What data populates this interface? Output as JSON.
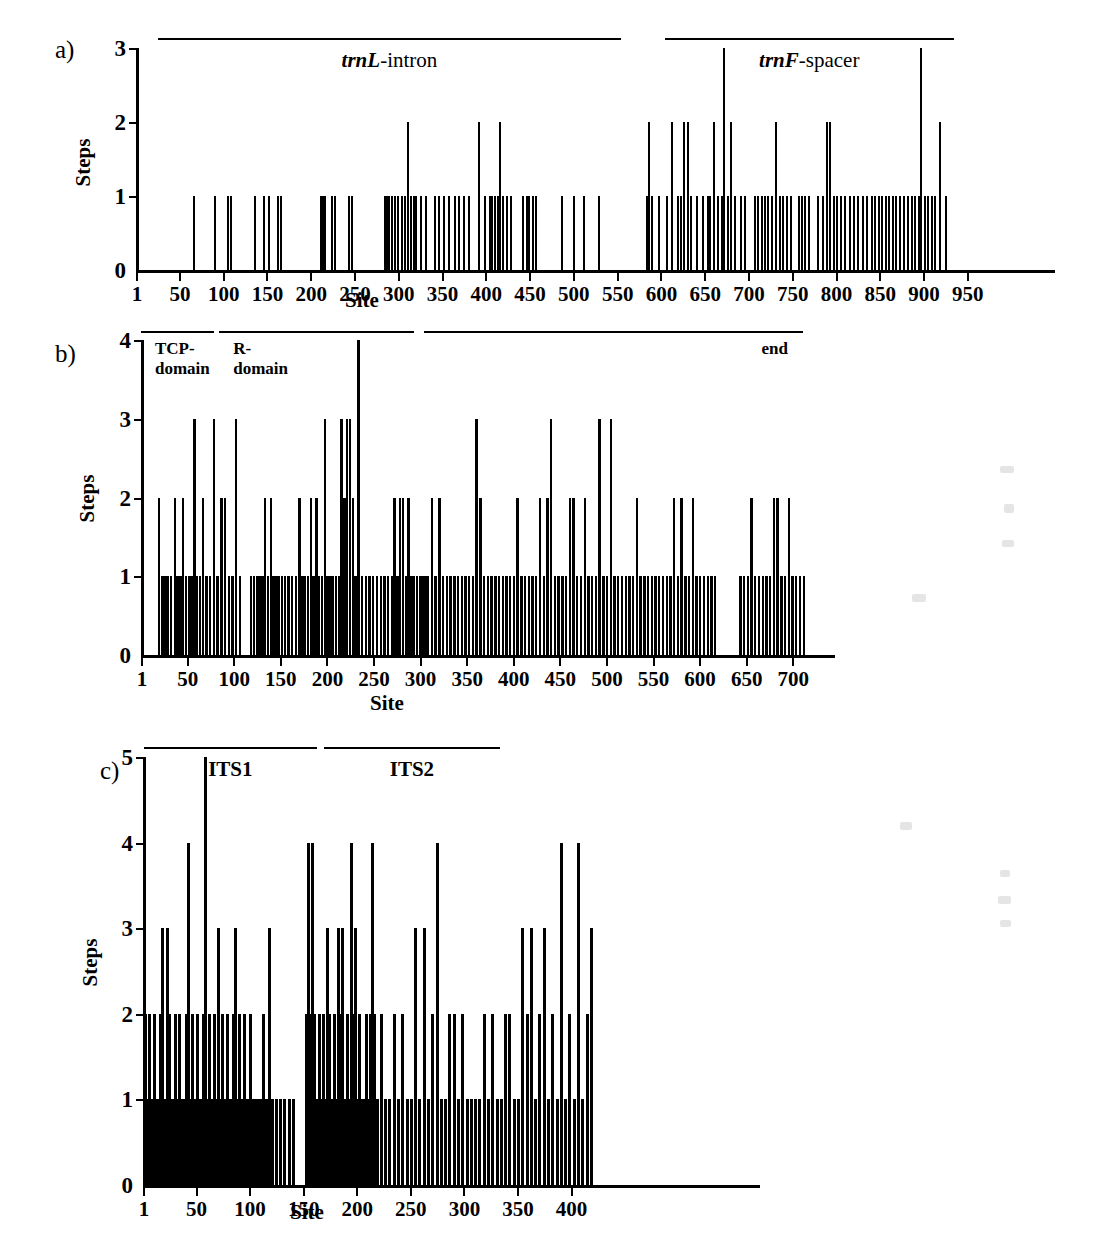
{
  "figure": {
    "panels": [
      {
        "letter": "a)",
        "ylabel": "Steps",
        "xlabel": "Site",
        "yticks": [
          "0",
          "1",
          "2",
          "3"
        ],
        "xticks": [
          "1",
          "50",
          "100",
          "150",
          "200",
          "250",
          "300",
          "350",
          "400",
          "450",
          "500",
          "550",
          "600",
          "650",
          "700",
          "750",
          "800",
          "850",
          "900",
          "950"
        ],
        "regions": [
          {
            "label_html": "<i>trnL</i>-intron",
            "start": 26,
            "end": 555
          },
          {
            "label_html": "<i>trnF</i>-spacer",
            "start": 605,
            "end": 935
          }
        ]
      },
      {
        "letter": "b)",
        "ylabel": "Steps",
        "xlabel": "Site",
        "yticks": [
          "0",
          "1",
          "2",
          "3",
          "4"
        ],
        "xticks": [
          "1",
          "50",
          "100",
          "150",
          "200",
          "250",
          "300",
          "350",
          "400",
          "450",
          "500",
          "550",
          "600",
          "650",
          "700"
        ],
        "regions": [
          {
            "label_html": "TCP-<br>domain",
            "start": 1,
            "end": 79
          },
          {
            "label_html": "R-<br>domain",
            "start": 85,
            "end": 294
          },
          {
            "label_html": "end",
            "start": 305,
            "end": 712
          }
        ]
      },
      {
        "letter": "c)",
        "ylabel": "Steps",
        "xlabel": "Site",
        "yticks": [
          "0",
          "1",
          "2",
          "3",
          "4",
          "5"
        ],
        "xticks": [
          "1",
          "50",
          "100",
          "150",
          "200",
          "250",
          "300",
          "350",
          "400"
        ],
        "regions": [
          {
            "label_html": "ITS1",
            "start": 2,
            "end": 163
          },
          {
            "label_html": "ITS2",
            "start": 170,
            "end": 334
          }
        ]
      }
    ]
  },
  "chart_data": [
    {
      "type": "bar",
      "panel": "a",
      "title": "trnL-trnF region step distribution",
      "xlabel": "Site",
      "ylabel": "Steps",
      "xlim": [
        1,
        960
      ],
      "ylim": [
        0,
        3
      ],
      "xticks": [
        1,
        50,
        100,
        150,
        200,
        250,
        300,
        350,
        400,
        450,
        500,
        550,
        600,
        650,
        700,
        750,
        800,
        850,
        900,
        950
      ],
      "yticks": [
        0,
        1,
        2,
        3
      ],
      "grid": false,
      "legend": null,
      "annotations": [
        {
          "text": "trnL-intron",
          "span": [
            26,
            555
          ]
        },
        {
          "text": "trnF-spacer",
          "span": [
            605,
            935
          ]
        }
      ],
      "x": [
        66,
        90,
        105,
        108,
        136,
        146,
        152,
        162,
        166,
        211,
        213,
        216,
        224,
        227,
        243,
        247,
        284,
        286,
        289,
        292,
        296,
        299,
        304,
        307,
        311,
        314,
        317,
        320,
        325,
        331,
        341,
        346,
        352,
        357,
        364,
        369,
        375,
        380,
        392,
        398,
        404,
        407,
        410,
        413,
        416,
        419,
        424,
        428,
        442,
        446,
        449,
        453,
        457,
        487,
        500,
        512,
        529,
        583,
        586,
        589,
        597,
        606,
        612,
        619,
        622,
        626,
        630,
        634,
        641,
        648,
        653,
        656,
        660,
        665,
        669,
        672,
        676,
        680,
        684,
        691,
        696,
        707,
        710,
        715,
        718,
        722,
        726,
        731,
        735,
        739,
        744,
        748,
        757,
        760,
        764,
        768,
        779,
        784,
        789,
        793,
        797,
        800,
        805,
        810,
        815,
        820,
        825,
        830,
        835,
        840,
        844,
        848,
        852,
        856,
        860,
        864,
        868,
        873,
        877,
        882,
        886,
        890,
        894,
        897,
        901,
        905,
        909,
        913,
        918,
        925
      ],
      "values": [
        1,
        1,
        1,
        1,
        1,
        1,
        1,
        1,
        1,
        1,
        1,
        1,
        1,
        1,
        1,
        1,
        1,
        1,
        1,
        1,
        1,
        1,
        1,
        1,
        2,
        1,
        1,
        1,
        1,
        1,
        1,
        1,
        1,
        1,
        1,
        1,
        1,
        1,
        2,
        1,
        1,
        1,
        1,
        1,
        2,
        1,
        1,
        1,
        1,
        1,
        1,
        1,
        1,
        1,
        1,
        1,
        1,
        1,
        2,
        1,
        1,
        1,
        2,
        1,
        1,
        2,
        2,
        1,
        1,
        1,
        1,
        1,
        2,
        1,
        1,
        3,
        1,
        2,
        1,
        1,
        1,
        1,
        1,
        1,
        1,
        1,
        1,
        2,
        1,
        1,
        1,
        1,
        1,
        1,
        1,
        1,
        1,
        1,
        2,
        2,
        1,
        1,
        1,
        1,
        1,
        1,
        1,
        1,
        1,
        1,
        1,
        1,
        1,
        1,
        1,
        1,
        1,
        1,
        1,
        1,
        1,
        1,
        1,
        3,
        1,
        1,
        1,
        1,
        2,
        1
      ]
    },
    {
      "type": "bar",
      "panel": "b",
      "title": "TCP gene region step distribution",
      "xlabel": "Site",
      "ylabel": "Steps",
      "xlim": [
        1,
        740
      ],
      "ylim": [
        0,
        4
      ],
      "xticks": [
        1,
        50,
        100,
        150,
        200,
        250,
        300,
        350,
        400,
        450,
        500,
        550,
        600,
        650,
        700
      ],
      "yticks": [
        0,
        1,
        2,
        3,
        4
      ],
      "grid": false,
      "legend": null,
      "annotations": [
        {
          "text": "TCP-domain",
          "span": [
            1,
            79
          ]
        },
        {
          "text": "R-domain",
          "span": [
            85,
            294
          ]
        },
        {
          "text": "end",
          "span": [
            305,
            712
          ]
        }
      ],
      "x": [
        19,
        23,
        26,
        29,
        32,
        36,
        39,
        42,
        45,
        48,
        51,
        54,
        57,
        60,
        63,
        66,
        70,
        74,
        78,
        82,
        86,
        90,
        94,
        98,
        102,
        106,
        118,
        121,
        124,
        127,
        130,
        133,
        136,
        139,
        142,
        145,
        148,
        151,
        154,
        158,
        162,
        166,
        170,
        173,
        176,
        179,
        182,
        185,
        188,
        191,
        194,
        197,
        200,
        203,
        206,
        209,
        212,
        215,
        218,
        221,
        224,
        227,
        230,
        233,
        237,
        241,
        245,
        249,
        253,
        257,
        261,
        265,
        269,
        272,
        275,
        278,
        281,
        284,
        287,
        290,
        293,
        296,
        299,
        302,
        305,
        308,
        312,
        316,
        320,
        324,
        328,
        332,
        336,
        340,
        344,
        348,
        352,
        356,
        360,
        364,
        368,
        372,
        376,
        380,
        384,
        388,
        392,
        396,
        400,
        404,
        408,
        412,
        416,
        420,
        424,
        428,
        432,
        436,
        440,
        444,
        448,
        452,
        456,
        460,
        464,
        468,
        472,
        476,
        480,
        484,
        488,
        492,
        496,
        500,
        504,
        508,
        512,
        516,
        520,
        524,
        528,
        532,
        536,
        540,
        544,
        548,
        552,
        556,
        560,
        564,
        568,
        572,
        576,
        580,
        584,
        588,
        592,
        596,
        600,
        604,
        608,
        612,
        616,
        643,
        647,
        651,
        655,
        659,
        663,
        667,
        671,
        675,
        679,
        683,
        687,
        691,
        695,
        699,
        703,
        707,
        711,
        730
      ],
      "values": [
        2,
        1,
        1,
        1,
        1,
        2,
        1,
        1,
        2,
        1,
        1,
        1,
        3,
        1,
        1,
        2,
        1,
        1,
        3,
        1,
        2,
        2,
        1,
        1,
        3,
        1,
        1,
        1,
        1,
        1,
        1,
        2,
        1,
        2,
        1,
        1,
        1,
        1,
        1,
        1,
        1,
        1,
        2,
        1,
        1,
        1,
        2,
        1,
        2,
        1,
        1,
        3,
        1,
        1,
        1,
        1,
        1,
        3,
        2,
        3,
        3,
        2,
        1,
        4,
        1,
        1,
        1,
        1,
        1,
        1,
        1,
        1,
        1,
        2,
        1,
        2,
        2,
        1,
        2,
        1,
        1,
        1,
        1,
        1,
        1,
        1,
        2,
        1,
        2,
        1,
        1,
        1,
        1,
        1,
        1,
        1,
        1,
        1,
        3,
        2,
        1,
        1,
        1,
        1,
        1,
        1,
        1,
        1,
        1,
        2,
        1,
        1,
        1,
        1,
        1,
        2,
        1,
        2,
        3,
        1,
        1,
        1,
        1,
        2,
        2,
        1,
        1,
        2,
        1,
        1,
        1,
        3,
        1,
        1,
        3,
        1,
        1,
        1,
        1,
        1,
        1,
        2,
        1,
        1,
        1,
        1,
        1,
        1,
        1,
        1,
        1,
        2,
        1,
        2,
        1,
        1,
        2,
        1,
        1,
        1,
        1,
        1,
        1,
        1,
        1,
        1,
        2,
        1,
        1,
        1,
        1,
        1,
        2,
        2,
        1,
        1,
        2,
        1,
        1,
        1,
        1
      ],
      "max_site": 730
    },
    {
      "type": "bar",
      "panel": "c",
      "title": "ITS region step distribution",
      "xlabel": "Site",
      "ylabel": "Steps",
      "xlim": [
        1,
        425
      ],
      "ylim": [
        0,
        5
      ],
      "xticks": [
        1,
        50,
        100,
        150,
        200,
        250,
        300,
        350,
        400
      ],
      "yticks": [
        0,
        1,
        2,
        3,
        4,
        5
      ],
      "grid": false,
      "legend": null,
      "annotations": [
        {
          "text": "ITS1",
          "span": [
            2,
            163
          ]
        },
        {
          "text": "ITS2",
          "span": [
            170,
            334
          ]
        }
      ],
      "x": [
        2,
        4,
        6,
        8,
        10,
        12,
        14,
        16,
        18,
        20,
        22,
        24,
        26,
        28,
        30,
        32,
        34,
        36,
        38,
        40,
        42,
        44,
        46,
        48,
        50,
        52,
        54,
        56,
        58,
        60,
        62,
        64,
        66,
        68,
        70,
        72,
        74,
        76,
        78,
        80,
        82,
        84,
        86,
        88,
        90,
        92,
        94,
        96,
        98,
        100,
        102,
        104,
        106,
        108,
        110,
        112,
        114,
        116,
        118,
        120,
        124,
        128,
        132,
        136,
        140,
        152,
        154,
        156,
        158,
        160,
        162,
        164,
        166,
        168,
        170,
        172,
        174,
        176,
        178,
        180,
        182,
        184,
        186,
        188,
        190,
        192,
        194,
        196,
        198,
        200,
        202,
        204,
        206,
        208,
        210,
        212,
        214,
        216,
        218,
        222,
        226,
        230,
        234,
        238,
        242,
        246,
        250,
        254,
        258,
        262,
        266,
        270,
        274,
        278,
        282,
        286,
        290,
        294,
        298,
        302,
        306,
        310,
        314,
        318,
        322,
        326,
        330,
        334,
        338,
        342,
        346,
        350,
        354,
        358,
        362,
        366,
        370,
        374,
        378,
        382,
        386,
        390,
        394,
        398,
        402,
        406,
        410,
        414,
        418
      ],
      "values": [
        2,
        1,
        2,
        1,
        2,
        1,
        1,
        2,
        3,
        1,
        3,
        2,
        1,
        1,
        2,
        1,
        2,
        1,
        1,
        2,
        4,
        1,
        2,
        1,
        2,
        1,
        1,
        2,
        5,
        1,
        2,
        1,
        2,
        1,
        3,
        1,
        2,
        1,
        2,
        1,
        1,
        2,
        3,
        1,
        2,
        1,
        2,
        1,
        1,
        2,
        1,
        1,
        1,
        1,
        1,
        2,
        1,
        1,
        3,
        1,
        1,
        1,
        1,
        1,
        1,
        2,
        4,
        2,
        4,
        2,
        1,
        2,
        1,
        2,
        1,
        3,
        2,
        1,
        2,
        1,
        3,
        2,
        3,
        1,
        2,
        1,
        4,
        2,
        3,
        1,
        2,
        1,
        1,
        2,
        1,
        2,
        4,
        2,
        1,
        2,
        1,
        1,
        2,
        1,
        2,
        1,
        1,
        3,
        1,
        3,
        1,
        2,
        4,
        1,
        1,
        2,
        2,
        1,
        2,
        1,
        1,
        1,
        1,
        2,
        1,
        2,
        1,
        1,
        2,
        2,
        1,
        1,
        3,
        2,
        3,
        1,
        2,
        3,
        1,
        2,
        1,
        4,
        1,
        2,
        1,
        4,
        1,
        2,
        3
      ]
    }
  ]
}
